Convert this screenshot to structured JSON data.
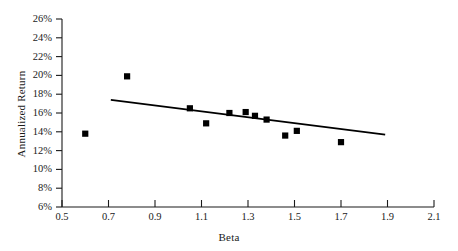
{
  "chart_data": {
    "type": "scatter",
    "title": "",
    "xlabel": "Beta",
    "ylabel": "Annualized Return",
    "xlim": [
      0.5,
      2.1
    ],
    "ylim": [
      6,
      26
    ],
    "grid": false,
    "legend": null,
    "x_ticks": [
      "0.5",
      "0.7",
      "0.9",
      "1.1",
      "1.3",
      "1.5",
      "1.7",
      "1.9",
      "2.1"
    ],
    "x_tick_values": [
      0.5,
      0.7,
      0.9,
      1.1,
      1.3,
      1.5,
      1.7,
      1.9,
      2.1
    ],
    "y_ticks": [
      "6%",
      "8%",
      "10%",
      "12%",
      "14%",
      "16%",
      "18%",
      "20%",
      "22%",
      "24%",
      "26%"
    ],
    "y_tick_values": [
      6,
      8,
      10,
      12,
      14,
      16,
      18,
      20,
      22,
      24,
      26
    ],
    "marker": "square",
    "marker_color": "#000000",
    "points": [
      {
        "x": 0.6,
        "y": 13.8
      },
      {
        "x": 0.78,
        "y": 19.9
      },
      {
        "x": 1.05,
        "y": 16.5
      },
      {
        "x": 1.12,
        "y": 14.9
      },
      {
        "x": 1.22,
        "y": 16.0
      },
      {
        "x": 1.29,
        "y": 16.1
      },
      {
        "x": 1.33,
        "y": 15.7
      },
      {
        "x": 1.38,
        "y": 15.3
      },
      {
        "x": 1.46,
        "y": 13.6
      },
      {
        "x": 1.51,
        "y": 14.1
      },
      {
        "x": 1.7,
        "y": 12.9
      }
    ],
    "trendline": {
      "type": "linear",
      "color": "#000000",
      "x_start": 0.71,
      "y_start": 17.4,
      "x_end": 1.89,
      "y_end": 13.7
    }
  }
}
